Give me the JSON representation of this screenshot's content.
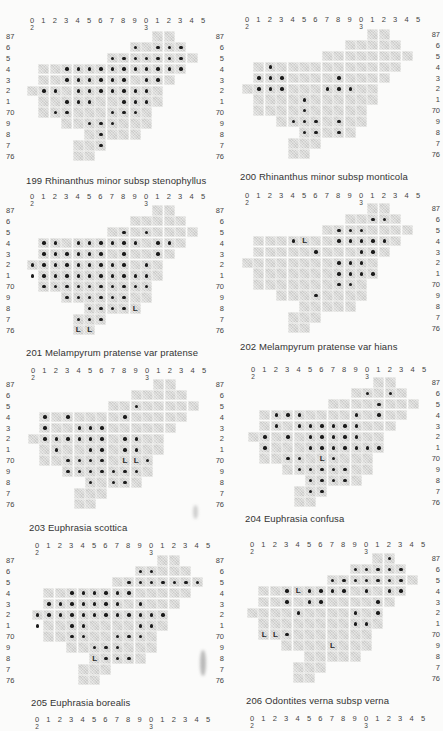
{
  "page": {
    "column_labels": [
      "0",
      "1",
      "2",
      "3",
      "4",
      "5",
      "6",
      "7",
      "8",
      "9",
      "0",
      "1",
      "2",
      "3",
      "4",
      "5"
    ],
    "column_label_subscripts": {
      "0": "2",
      "10": "3"
    },
    "row_labels": [
      "87",
      "6",
      "5",
      "4",
      "3",
      "2",
      "1",
      "70",
      "9",
      "8",
      "7",
      "76"
    ],
    "grid_shape": [
      {
        "row": 0,
        "from": 11,
        "to": 12
      },
      {
        "row": 1,
        "from": 9,
        "to": 13
      },
      {
        "row": 2,
        "from": 7,
        "to": 14
      },
      {
        "row": 3,
        "from": 1,
        "to": 13
      },
      {
        "row": 4,
        "from": 1,
        "to": 12
      },
      {
        "row": 5,
        "from": 0,
        "to": 11
      },
      {
        "row": 6,
        "from": 1,
        "to": 11
      },
      {
        "row": 7,
        "from": 1,
        "to": 10
      },
      {
        "row": 8,
        "from": 3,
        "to": 10
      },
      {
        "row": 9,
        "from": 5,
        "to": 9
      },
      {
        "row": 10,
        "from": 4,
        "to": 6
      },
      {
        "row": 11,
        "from": 4,
        "to": 5
      }
    ],
    "legend": {
      "dot": "record",
      "L": "literature record"
    },
    "colors": {
      "cell": "#d9d9d7",
      "dot": "#1b1b1b",
      "paper": "#fbfbfa"
    }
  },
  "maps": [
    {
      "number": "199",
      "caption": "199  Rhinanthus minor subsp  stenophyllus",
      "x": 27,
      "y": 31,
      "labels_y": 17,
      "row_labels_side": "left",
      "row_labels_x": 6,
      "caption_x": 26,
      "caption_y": 175,
      "dots": [
        [
          1,
          9
        ],
        [
          1,
          11
        ],
        [
          1,
          12
        ],
        [
          1,
          13
        ],
        [
          2,
          7
        ],
        [
          2,
          8
        ],
        [
          2,
          9
        ],
        [
          2,
          10
        ],
        [
          2,
          11
        ],
        [
          2,
          12
        ],
        [
          2,
          13
        ],
        [
          3,
          3
        ],
        [
          3,
          4
        ],
        [
          3,
          5
        ],
        [
          3,
          6
        ],
        [
          3,
          7
        ],
        [
          3,
          8
        ],
        [
          3,
          9
        ],
        [
          3,
          10
        ],
        [
          3,
          11
        ],
        [
          3,
          12
        ],
        [
          3,
          13
        ],
        [
          4,
          3
        ],
        [
          4,
          4
        ],
        [
          4,
          5
        ],
        [
          4,
          6
        ],
        [
          4,
          7
        ],
        [
          4,
          8
        ],
        [
          4,
          10
        ],
        [
          4,
          11
        ],
        [
          5,
          1
        ],
        [
          5,
          2
        ],
        [
          5,
          4
        ],
        [
          5,
          5
        ],
        [
          5,
          6
        ],
        [
          5,
          7
        ],
        [
          5,
          8
        ],
        [
          5,
          9
        ],
        [
          5,
          10
        ],
        [
          6,
          3
        ],
        [
          6,
          4
        ],
        [
          6,
          5
        ],
        [
          6,
          8
        ],
        [
          6,
          9
        ],
        [
          6,
          10
        ],
        [
          7,
          2
        ],
        [
          7,
          3
        ],
        [
          7,
          7
        ],
        [
          7,
          8
        ],
        [
          7,
          9
        ],
        [
          8,
          5
        ],
        [
          8,
          6
        ],
        [
          8,
          7
        ],
        [
          9,
          6
        ],
        [
          10,
          6
        ]
      ],
      "L": []
    },
    {
      "number": "200",
      "caption": "200  Rhinanthus minor subsp  monticola",
      "x": 242,
      "y": 29,
      "labels_y": 16,
      "row_labels_side": "right",
      "row_labels_x": 424,
      "caption_x": 240,
      "caption_y": 171,
      "dots": [
        [
          3,
          2
        ],
        [
          4,
          1
        ],
        [
          4,
          2
        ],
        [
          4,
          3
        ],
        [
          4,
          8
        ],
        [
          5,
          1
        ],
        [
          5,
          2
        ],
        [
          5,
          3
        ],
        [
          5,
          7
        ],
        [
          5,
          8
        ],
        [
          5,
          9
        ],
        [
          6,
          5
        ],
        [
          7,
          5
        ],
        [
          8,
          4
        ],
        [
          8,
          5
        ],
        [
          8,
          6
        ],
        [
          8,
          8
        ],
        [
          9,
          5
        ],
        [
          9,
          6
        ],
        [
          9,
          8
        ]
      ],
      "L": []
    },
    {
      "number": "201",
      "caption": "201  Melampyrum pratense var  pratense",
      "x": 27,
      "y": 205,
      "labels_y": 193,
      "row_labels_side": "left",
      "row_labels_x": 6,
      "caption_x": 26,
      "caption_y": 347,
      "dots": [
        [
          2,
          8
        ],
        [
          2,
          10
        ],
        [
          3,
          1
        ],
        [
          3,
          2
        ],
        [
          3,
          4
        ],
        [
          3,
          5
        ],
        [
          3,
          6
        ],
        [
          3,
          7
        ],
        [
          3,
          8
        ],
        [
          3,
          9
        ],
        [
          3,
          11
        ],
        [
          3,
          12
        ],
        [
          4,
          1
        ],
        [
          4,
          2
        ],
        [
          4,
          3
        ],
        [
          4,
          4
        ],
        [
          4,
          5
        ],
        [
          4,
          6
        ],
        [
          4,
          8
        ],
        [
          4,
          11
        ],
        [
          5,
          0
        ],
        [
          5,
          1
        ],
        [
          5,
          2
        ],
        [
          5,
          3
        ],
        [
          5,
          4
        ],
        [
          5,
          5
        ],
        [
          5,
          6
        ],
        [
          5,
          7
        ],
        [
          5,
          8
        ],
        [
          5,
          10
        ],
        [
          6,
          0
        ],
        [
          6,
          1
        ],
        [
          6,
          2
        ],
        [
          6,
          3
        ],
        [
          6,
          4
        ],
        [
          6,
          5
        ],
        [
          6,
          6
        ],
        [
          6,
          7
        ],
        [
          6,
          8
        ],
        [
          6,
          9
        ],
        [
          6,
          10
        ],
        [
          7,
          1
        ],
        [
          7,
          2
        ],
        [
          7,
          3
        ],
        [
          7,
          4
        ],
        [
          7,
          5
        ],
        [
          7,
          6
        ],
        [
          7,
          7
        ],
        [
          7,
          8
        ],
        [
          7,
          9
        ],
        [
          7,
          10
        ],
        [
          8,
          3
        ],
        [
          8,
          4
        ],
        [
          8,
          5
        ],
        [
          8,
          6
        ],
        [
          8,
          7
        ],
        [
          8,
          8
        ],
        [
          9,
          5
        ],
        [
          9,
          6
        ],
        [
          9,
          7
        ],
        [
          9,
          8
        ],
        [
          10,
          4
        ],
        [
          10,
          5
        ],
        [
          10,
          6
        ]
      ],
      "L": [
        [
          9,
          9
        ],
        [
          11,
          4
        ],
        [
          11,
          5
        ]
      ]
    },
    {
      "number": "202",
      "caption": "202  Melampyrum pratense var  hians",
      "x": 242,
      "y": 203,
      "labels_y": 192,
      "row_labels_side": "right",
      "row_labels_x": 424,
      "caption_x": 240,
      "caption_y": 341,
      "dots": [
        [
          1,
          11
        ],
        [
          1,
          12
        ],
        [
          2,
          8
        ],
        [
          2,
          9
        ],
        [
          2,
          10
        ],
        [
          3,
          4
        ],
        [
          3,
          8
        ],
        [
          3,
          9
        ],
        [
          3,
          10
        ],
        [
          3,
          11
        ],
        [
          3,
          12
        ],
        [
          4,
          6
        ],
        [
          4,
          10
        ],
        [
          4,
          11
        ],
        [
          5,
          8
        ],
        [
          5,
          9
        ],
        [
          5,
          10
        ],
        [
          6,
          8
        ],
        [
          6,
          9
        ],
        [
          6,
          10
        ],
        [
          6,
          11
        ],
        [
          7,
          8
        ],
        [
          7,
          9
        ],
        [
          8,
          6
        ]
      ],
      "L": [
        [
          3,
          5
        ]
      ]
    },
    {
      "number": "203",
      "caption": "203  Euphrasia scottica",
      "x": 28,
      "y": 379,
      "labels_y": 367,
      "row_labels_side": "left",
      "row_labels_x": 6,
      "caption_x": 29,
      "caption_y": 522,
      "dots": [
        [
          2,
          9
        ],
        [
          3,
          1
        ],
        [
          3,
          3
        ],
        [
          3,
          8
        ],
        [
          4,
          1
        ],
        [
          4,
          4
        ],
        [
          4,
          5
        ],
        [
          4,
          6
        ],
        [
          5,
          1
        ],
        [
          5,
          2
        ],
        [
          5,
          3
        ],
        [
          5,
          4
        ],
        [
          5,
          5
        ],
        [
          5,
          6
        ],
        [
          5,
          8
        ],
        [
          5,
          9
        ],
        [
          6,
          2
        ],
        [
          6,
          5
        ],
        [
          6,
          6
        ],
        [
          6,
          8
        ],
        [
          6,
          9
        ],
        [
          7,
          3
        ],
        [
          7,
          4
        ],
        [
          7,
          5
        ],
        [
          7,
          6
        ],
        [
          7,
          10
        ],
        [
          8,
          3
        ],
        [
          8,
          4
        ],
        [
          8,
          5
        ],
        [
          8,
          6
        ],
        [
          8,
          7
        ],
        [
          8,
          8
        ],
        [
          8,
          9
        ],
        [
          9,
          5
        ],
        [
          9,
          7
        ],
        [
          9,
          8
        ]
      ],
      "L": [
        [
          7,
          8
        ],
        [
          7,
          9
        ]
      ]
    },
    {
      "number": "204",
      "caption": "204  Euphrasia confusa",
      "x": 248,
      "y": 377,
      "labels_y": 366,
      "row_labels_side": "right",
      "row_labels_x": 424,
      "caption_x": 245,
      "caption_y": 513,
      "dots": [
        [
          1,
          10
        ],
        [
          1,
          12
        ],
        [
          2,
          11
        ],
        [
          3,
          2
        ],
        [
          3,
          3
        ],
        [
          3,
          4
        ],
        [
          3,
          9
        ],
        [
          3,
          11
        ],
        [
          4,
          2
        ],
        [
          4,
          4
        ],
        [
          4,
          5
        ],
        [
          4,
          6
        ],
        [
          4,
          7
        ],
        [
          4,
          8
        ],
        [
          4,
          9
        ],
        [
          5,
          1
        ],
        [
          5,
          3
        ],
        [
          5,
          5
        ],
        [
          5,
          6
        ],
        [
          5,
          7
        ],
        [
          5,
          8
        ],
        [
          5,
          9
        ],
        [
          6,
          1
        ],
        [
          6,
          5
        ],
        [
          6,
          6
        ],
        [
          6,
          7
        ],
        [
          6,
          8
        ],
        [
          6,
          9
        ],
        [
          6,
          10
        ],
        [
          6,
          11
        ],
        [
          7,
          3
        ],
        [
          7,
          4
        ],
        [
          7,
          7
        ],
        [
          8,
          4
        ],
        [
          8,
          5
        ],
        [
          8,
          6
        ],
        [
          8,
          7
        ],
        [
          8,
          8
        ],
        [
          9,
          5
        ],
        [
          9,
          6
        ],
        [
          9,
          7
        ],
        [
          9,
          8
        ],
        [
          10,
          5
        ],
        [
          10,
          6
        ]
      ],
      "L": [
        [
          7,
          6
        ]
      ]
    },
    {
      "number": "205",
      "caption": "205  Euphrasia borealis",
      "x": 32,
      "y": 555,
      "labels_y": 542,
      "row_labels_side": "left",
      "row_labels_x": 6,
      "caption_x": 31,
      "caption_y": 697,
      "dots": [
        [
          1,
          9
        ],
        [
          1,
          10
        ],
        [
          2,
          8
        ],
        [
          2,
          9
        ],
        [
          2,
          10
        ],
        [
          2,
          11
        ],
        [
          2,
          12
        ],
        [
          2,
          13
        ],
        [
          2,
          14
        ],
        [
          3,
          3
        ],
        [
          3,
          4
        ],
        [
          3,
          5
        ],
        [
          3,
          6
        ],
        [
          3,
          7
        ],
        [
          3,
          8
        ],
        [
          4,
          1
        ],
        [
          4,
          2
        ],
        [
          4,
          3
        ],
        [
          4,
          4
        ],
        [
          4,
          5
        ],
        [
          4,
          6
        ],
        [
          4,
          7
        ],
        [
          4,
          9
        ],
        [
          5,
          0
        ],
        [
          5,
          1
        ],
        [
          5,
          2
        ],
        [
          5,
          3
        ],
        [
          5,
          4
        ],
        [
          5,
          5
        ],
        [
          5,
          6
        ],
        [
          5,
          7
        ],
        [
          5,
          8
        ],
        [
          5,
          9
        ],
        [
          5,
          10
        ],
        [
          5,
          11
        ],
        [
          6,
          0
        ],
        [
          6,
          3
        ],
        [
          6,
          4
        ],
        [
          6,
          9
        ],
        [
          6,
          10
        ],
        [
          7,
          3
        ],
        [
          7,
          4
        ],
        [
          7,
          7
        ],
        [
          7,
          8
        ],
        [
          7,
          9
        ],
        [
          8,
          5
        ],
        [
          8,
          6
        ],
        [
          8,
          7
        ],
        [
          9,
          6
        ],
        [
          9,
          7
        ],
        [
          9,
          8
        ]
      ],
      "L": [
        [
          9,
          5
        ]
      ]
    },
    {
      "number": "206",
      "caption": "206  Odontites verna subsp  verna",
      "x": 247,
      "y": 553,
      "labels_y": 541,
      "row_labels_side": "right",
      "row_labels_x": 424,
      "caption_x": 246,
      "caption_y": 695,
      "dots": [
        [
          0,
          12
        ],
        [
          1,
          9
        ],
        [
          1,
          10
        ],
        [
          1,
          11
        ],
        [
          1,
          12
        ],
        [
          1,
          13
        ],
        [
          2,
          7
        ],
        [
          2,
          8
        ],
        [
          2,
          9
        ],
        [
          2,
          10
        ],
        [
          2,
          11
        ],
        [
          2,
          12
        ],
        [
          2,
          13
        ],
        [
          3,
          3
        ],
        [
          3,
          5
        ],
        [
          3,
          6
        ],
        [
          3,
          7
        ],
        [
          3,
          8
        ],
        [
          3,
          10
        ],
        [
          3,
          12
        ],
        [
          3,
          13
        ],
        [
          4,
          3
        ],
        [
          4,
          5
        ],
        [
          4,
          6
        ],
        [
          4,
          11
        ],
        [
          5,
          4
        ],
        [
          5,
          9
        ],
        [
          5,
          11
        ],
        [
          6,
          9
        ],
        [
          6,
          10
        ],
        [
          7,
          3
        ]
      ],
      "L": [
        [
          3,
          4
        ],
        [
          7,
          1
        ],
        [
          7,
          2
        ],
        [
          8,
          7
        ]
      ]
    }
  ],
  "bottom_axes": [
    {
      "x": 32,
      "y": 716
    },
    {
      "x": 247,
      "y": 715
    }
  ],
  "left_inner_row_labels": {
    "x": 208,
    "maps_y": [
      31,
      205,
      379,
      555
    ]
  }
}
